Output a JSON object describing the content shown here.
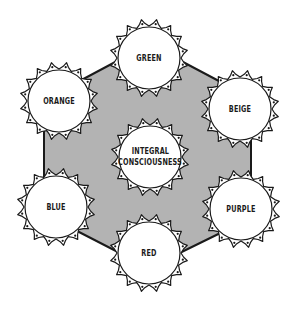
{
  "diagram": {
    "background": "#ffffff",
    "hexagon": {
      "fill": "#b3b3b3",
      "stroke": "#1a1a1a"
    },
    "center_node": {
      "label_line1": "INTEGRAL",
      "label_line2": "CONSCIOUSNESS",
      "cx": 150,
      "cy": 157
    },
    "nodes": [
      {
        "label": "GREEN",
        "cx": 149,
        "cy": 58
      },
      {
        "label": "BEIGE",
        "cx": 240,
        "cy": 109
      },
      {
        "label": "PURPLE",
        "cx": 241,
        "cy": 209
      },
      {
        "label": "RED",
        "cx": 149,
        "cy": 253
      },
      {
        "label": "BLUE",
        "cx": 56,
        "cy": 207
      },
      {
        "label": "ORANGE",
        "cx": 59,
        "cy": 101
      }
    ]
  }
}
